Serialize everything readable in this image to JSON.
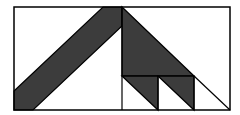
{
  "diagram": {
    "colors": {
      "background": "#ffffff",
      "fill": "#3c3c3c",
      "stroke": "#000000"
    },
    "frame": {
      "x": 14,
      "y": 7,
      "width": 216,
      "height": 103
    },
    "shapes": [
      {
        "name": "left-diagonal-band",
        "points": "14,91 103,7 122,7 122,26 33,110 14,110",
        "filled": true
      },
      {
        "name": "large-right-triangle",
        "points": "122,7 194,76 122,76",
        "filled": true
      },
      {
        "name": "small-triangle-1",
        "points": "122,76 158,76 158,110",
        "filled": true
      },
      {
        "name": "small-triangle-2",
        "points": "158,76 194,76 194,110",
        "filled": true
      }
    ],
    "lines": [
      {
        "name": "center-vertical",
        "x1": 122,
        "y1": 7,
        "x2": 122,
        "y2": 110
      },
      {
        "name": "mid-horizontal",
        "x1": 122,
        "y1": 76,
        "x2": 194,
        "y2": 76
      },
      {
        "name": "vertical-158",
        "x1": 158,
        "y1": 76,
        "x2": 158,
        "y2": 110
      },
      {
        "name": "vertical-194",
        "x1": 194,
        "y1": 76,
        "x2": 194,
        "y2": 110
      },
      {
        "name": "outer-diagonal",
        "x1": 194,
        "y1": 76,
        "x2": 230,
        "y2": 110
      }
    ]
  }
}
